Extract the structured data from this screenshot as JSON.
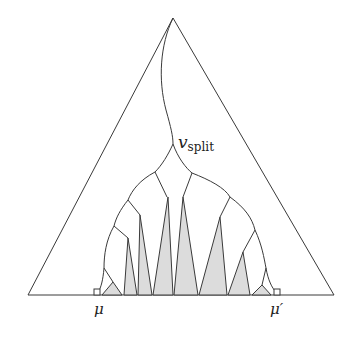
{
  "diagram": {
    "labels": {
      "v": "v",
      "split": "split",
      "mu": "μ",
      "mu_prime": "μ′"
    },
    "colors": {
      "stroke": "#3a3a3a",
      "fill": "#dcdcdc",
      "background": "#ffffff"
    }
  }
}
